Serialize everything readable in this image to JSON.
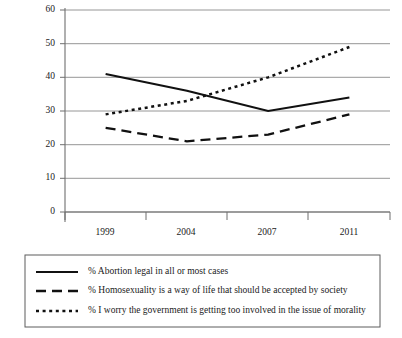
{
  "chart_data": {
    "type": "line",
    "title": "",
    "xlabel": "",
    "ylabel": "",
    "categories": [
      "1999",
      "2004",
      "2007",
      "2011"
    ],
    "ylim": [
      0,
      60
    ],
    "yticks": [
      0,
      10,
      20,
      30,
      40,
      50,
      60
    ],
    "grid": true,
    "legend_position": "bottom",
    "series": [
      {
        "name": "% Abortion legal in all or most cases",
        "style": "solid",
        "values": [
          41,
          36,
          30,
          34
        ]
      },
      {
        "name": "% Homosexuality is a way of life that should be accepted by society",
        "style": "dashed",
        "values": [
          25,
          21,
          23,
          29
        ]
      },
      {
        "name": "% I worry the government is getting too involved in the issue of morality",
        "style": "dotted",
        "values": [
          29,
          33,
          40,
          49
        ]
      }
    ]
  },
  "axis": {
    "ytick_labels": [
      "60",
      "50",
      "40",
      "30",
      "20",
      "10",
      "0"
    ],
    "xtick_labels": [
      "1999",
      "2004",
      "2007",
      "2011"
    ]
  },
  "legend": {
    "entries": [
      {
        "label": "% Abortion legal in all or most cases",
        "style": "solid"
      },
      {
        "label": "% Homosexuality is a way of life that should be accepted by society",
        "style": "dashed"
      },
      {
        "label": "% I worry the government is getting too involved in the issue of morality",
        "style": "dotted"
      }
    ]
  },
  "colors": {
    "series": "#111111",
    "grid": "#8a8a8a",
    "axis": "#6f6f6f",
    "text": "#1a1a1a",
    "background": "#ffffff"
  }
}
